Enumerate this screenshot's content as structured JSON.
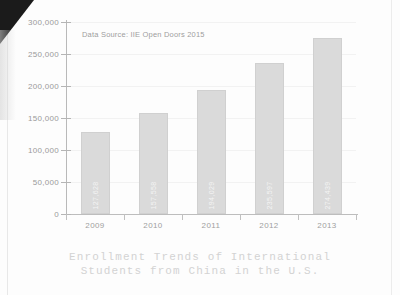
{
  "chart_data": {
    "type": "bar",
    "title": "Enrollment Trends of International Students from China in the U.S.",
    "title_line1": "Enrollment Trends of International",
    "title_line2": "Students from China in the U.S.",
    "source_note": "Data Source: IIE Open Doors 2015",
    "xlabel": "",
    "ylabel": "",
    "ylim": [
      0,
      300000
    ],
    "grid": true,
    "legend": null,
    "categories": [
      "2009",
      "2010",
      "2011",
      "2012",
      "2013"
    ],
    "values": [
      127628,
      157558,
      194029,
      235597,
      274439
    ],
    "value_labels": [
      "127,628",
      "157,558",
      "194,029",
      "235,597",
      "274,439"
    ],
    "y_ticks": [
      0,
      50000,
      100000,
      150000,
      200000,
      250000,
      300000
    ],
    "y_tick_labels": [
      "0",
      "50,000",
      "100,000",
      "150,000",
      "200,000",
      "250,000",
      "300,000"
    ],
    "bar_color": "#dadada",
    "text_color": "#9a9a9a",
    "title_color": "#d3d3d3"
  }
}
